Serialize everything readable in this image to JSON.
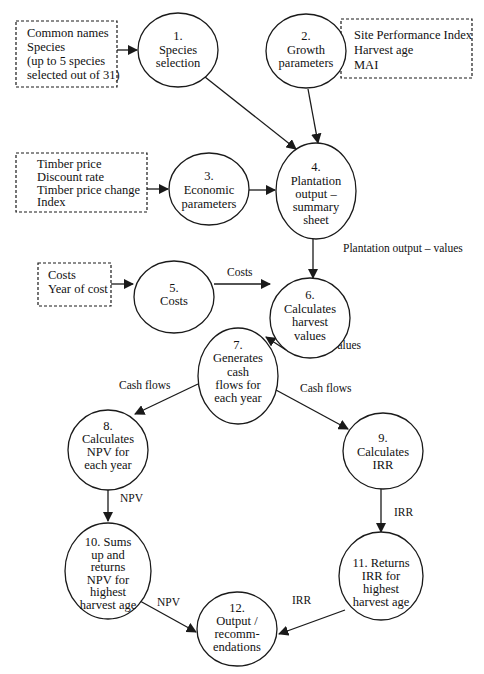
{
  "diagram": {
    "type": "flowchart",
    "colors": {
      "stroke": "#1a1a1a",
      "background": "#ffffff",
      "text": "#111111"
    },
    "input_boxes": [
      {
        "id": "in_species",
        "lines": [
          "Common names",
          "Species",
          "(up to 5 species",
          "selected out of 31)"
        ]
      },
      {
        "id": "in_growth",
        "lines": [
          "Site Performance Index",
          "Harvest age",
          "MAI"
        ]
      },
      {
        "id": "in_economic",
        "lines": [
          "Timber price",
          "Discount rate",
          "Timber price change",
          "Index"
        ]
      },
      {
        "id": "in_costs",
        "lines": [
          "Costs",
          "Year of cost"
        ]
      }
    ],
    "nodes": [
      {
        "id": "n1",
        "lines": [
          "1.",
          "Species",
          "selection"
        ]
      },
      {
        "id": "n2",
        "lines": [
          "2.",
          "Growth",
          "parameters"
        ]
      },
      {
        "id": "n3",
        "lines": [
          "3.",
          "Economic",
          "parameters"
        ]
      },
      {
        "id": "n4",
        "lines": [
          "4.",
          "Plantation",
          "output –",
          "summary",
          "sheet"
        ]
      },
      {
        "id": "n5",
        "lines": [
          "5.",
          "Costs"
        ]
      },
      {
        "id": "n6",
        "lines": [
          "6.",
          "Calculates",
          "harvest",
          "values"
        ]
      },
      {
        "id": "n7",
        "lines": [
          "7.",
          "Generates",
          "cash",
          "flows for",
          "each year"
        ]
      },
      {
        "id": "n8",
        "lines": [
          "8.",
          "Calculates",
          "NPV for",
          "each year"
        ]
      },
      {
        "id": "n9",
        "lines": [
          "9.",
          "Calculates",
          "IRR"
        ]
      },
      {
        "id": "n10",
        "lines": [
          "10.  Sums",
          "up and",
          "returns",
          "NPV for",
          "highest",
          "harvest age"
        ]
      },
      {
        "id": "n11",
        "lines": [
          "11. Returns",
          "IRR for",
          "highest",
          "harvest age"
        ]
      },
      {
        "id": "n12",
        "lines": [
          "12.",
          "Output /",
          "recomm-",
          "endations"
        ]
      }
    ],
    "edges": [
      {
        "from": "in_species",
        "to": "n1",
        "label": ""
      },
      {
        "from": "in_growth",
        "to": "n2",
        "label": ""
      },
      {
        "from": "in_economic",
        "to": "n3",
        "label": ""
      },
      {
        "from": "in_costs",
        "to": "n5",
        "label": ""
      },
      {
        "from": "n1",
        "to": "n4",
        "label": ""
      },
      {
        "from": "n2",
        "to": "n4",
        "label": ""
      },
      {
        "from": "n3",
        "to": "n4",
        "label": ""
      },
      {
        "from": "n4",
        "to": "n6",
        "label": "Plantation output – values"
      },
      {
        "from": "n5",
        "to": "n6",
        "label": "Costs"
      },
      {
        "from": "n6",
        "to": "n7",
        "label": "Harvest values"
      },
      {
        "from": "n7",
        "to": "n8",
        "label": "Cash flows"
      },
      {
        "from": "n7",
        "to": "n9",
        "label": "Cash flows"
      },
      {
        "from": "n8",
        "to": "n10",
        "label": "NPV"
      },
      {
        "from": "n9",
        "to": "n11",
        "label": "IRR"
      },
      {
        "from": "n10",
        "to": "n12",
        "label": "NPV"
      },
      {
        "from": "n11",
        "to": "n12",
        "label": "IRR"
      }
    ]
  }
}
